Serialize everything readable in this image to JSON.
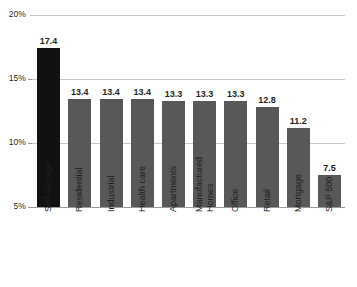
{
  "chart_data": {
    "type": "bar",
    "title": "",
    "subtitle": "",
    "xlabel": "",
    "ylabel": "",
    "ylim": [
      5,
      20
    ],
    "ytick_labels": [
      "20%",
      "15%",
      "10%",
      "5%"
    ],
    "ytick_values": [
      20,
      15,
      10,
      5
    ],
    "grid": true,
    "legend": "none",
    "value_suffix": "",
    "categories": [
      "Self-Storage",
      "Residential",
      "Industrial",
      "Health care",
      "Apartments",
      "Manufactured\nHomes",
      "Office",
      "Retail",
      "Mortgage",
      "S&P 500"
    ],
    "values": [
      17.4,
      13.4,
      13.4,
      13.4,
      13.3,
      13.3,
      13.3,
      12.8,
      11.2,
      7.5
    ],
    "value_labels": [
      "17.4",
      "13.4",
      "13.4",
      "13.4",
      "13.3",
      "13.3",
      "13.3",
      "12.8",
      "11.2",
      "7.5"
    ],
    "bar_colors": [
      "#111111",
      "#585858",
      "#585858",
      "#585858",
      "#585858",
      "#585858",
      "#585858",
      "#585858",
      "#585858",
      "#585858"
    ],
    "highlight_index": 0,
    "colors": {
      "highlight": "#111111",
      "bar": "#585858",
      "gridline": "#c9c9c9",
      "axis": "#9b9b9b",
      "text": "#231f20",
      "background": "#ffffff"
    }
  }
}
